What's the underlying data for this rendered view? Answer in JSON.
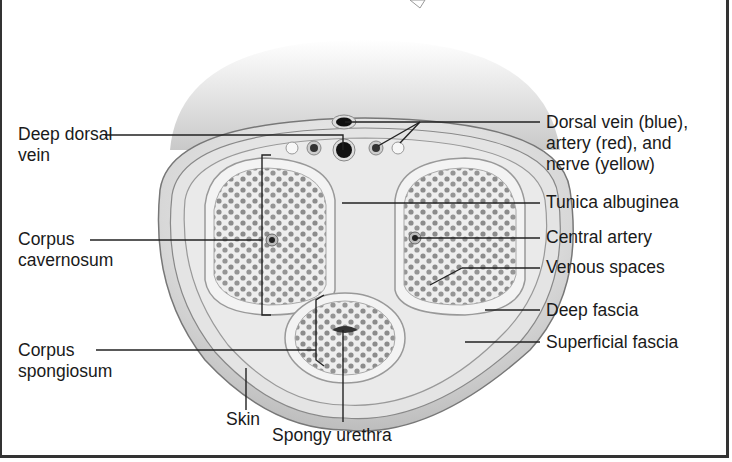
{
  "figure": {
    "type": "cross-section anatomical diagram"
  },
  "labels_left": [
    {
      "id": "deep-dorsal-vein",
      "text": "Deep dorsal\nvein"
    },
    {
      "id": "corpus-cavernosum",
      "text": "Corpus\ncavernosum"
    },
    {
      "id": "corpus-spongiosum",
      "text": "Corpus\nspongiosum"
    }
  ],
  "labels_right": [
    {
      "id": "dorsal-vessels",
      "text": "Dorsal vein (blue),\nartery (red), and\nnerve (yellow)"
    },
    {
      "id": "tunica-albuginea",
      "text": "Tunica albuginea"
    },
    {
      "id": "central-artery",
      "text": "Central artery"
    },
    {
      "id": "venous-spaces",
      "text": "Venous spaces"
    },
    {
      "id": "deep-fascia",
      "text": "Deep fascia"
    },
    {
      "id": "superficial-fascia",
      "text": "Superficial fascia"
    }
  ],
  "labels_bottom": [
    {
      "id": "skin",
      "text": "Skin"
    },
    {
      "id": "spongy-urethra",
      "text": "Spongy urethra"
    }
  ]
}
